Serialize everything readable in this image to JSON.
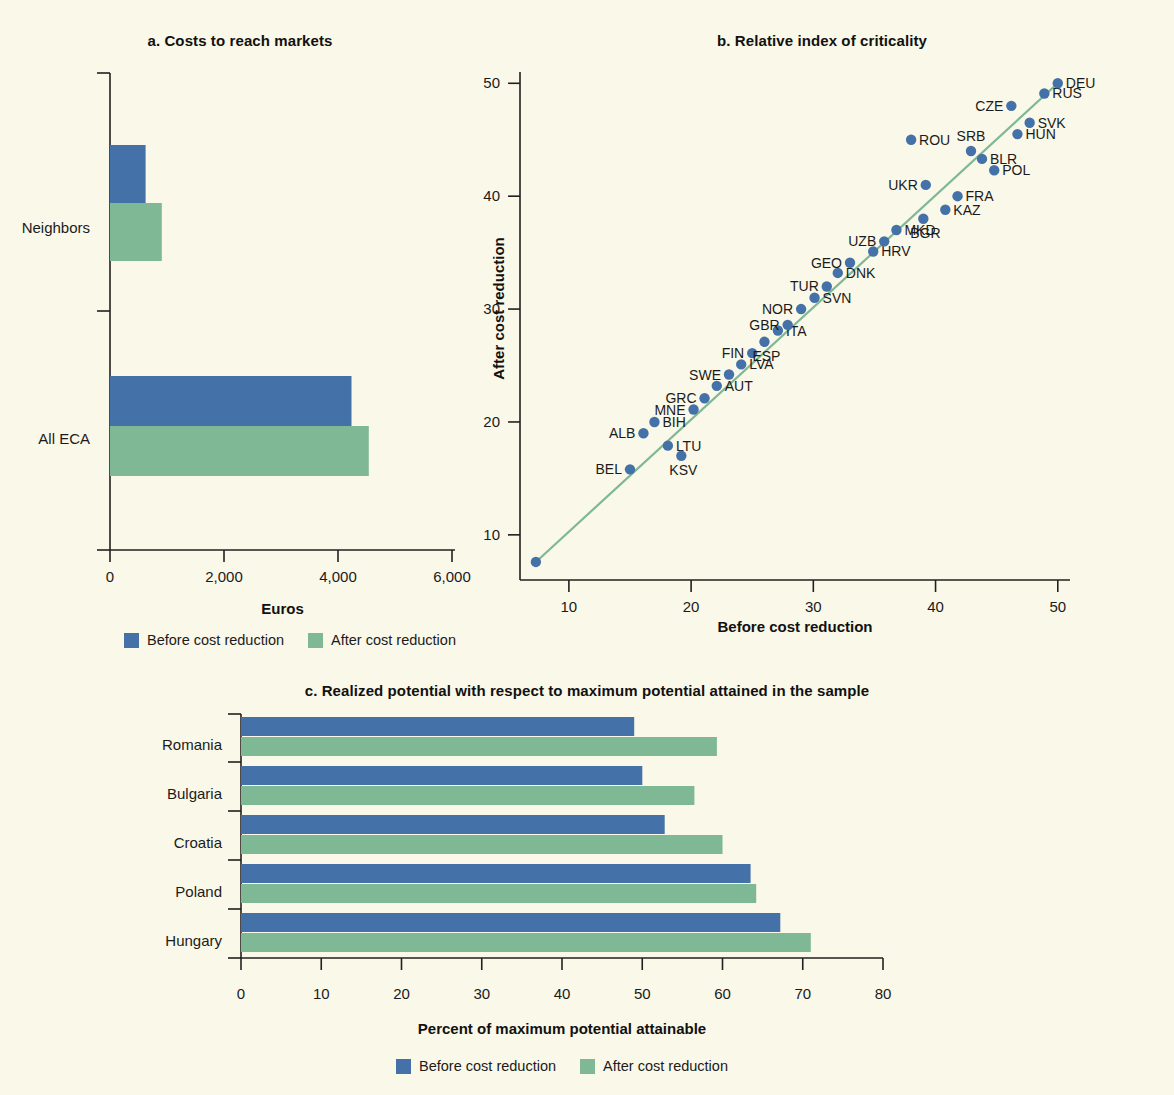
{
  "figure": {
    "background_color": "#faf8e8",
    "series_colors": {
      "before": "#4472a8",
      "after": "#7fb894",
      "fit_line": "#7fb894"
    }
  },
  "legend": {
    "before_label": "Before cost reduction",
    "after_label": "After cost reduction"
  },
  "panel_a": {
    "title": "a. Costs to reach markets",
    "xlabel": "Euros"
  },
  "panel_b": {
    "title": "b. Relative index of criticality",
    "xlabel": "Before cost reduction",
    "ylabel": "After cost reduction"
  },
  "panel_c": {
    "title": "c. Realized potential with respect to maximum potential attained in the sample",
    "xlabel": "Percent of maximum potential attainable"
  },
  "chart_data": [
    {
      "id": "a",
      "type": "bar",
      "orientation": "horizontal",
      "title": "a. Costs to reach markets",
      "xlabel": "Euros",
      "ylabel": "",
      "categories": [
        "Neighbors",
        "All ECA"
      ],
      "xlim": [
        0,
        6000
      ],
      "xticks": [
        0,
        2000,
        4000,
        6000
      ],
      "xticklabels": [
        "0",
        "2,000",
        "4,000",
        "6,000"
      ],
      "grid": false,
      "legend_position": "bottom",
      "series": [
        {
          "name": "Before cost reduction",
          "color": "#4472a8",
          "values": [
            620,
            4200
          ]
        },
        {
          "name": "After cost reduction",
          "color": "#7fb894",
          "values": [
            900,
            4500
          ]
        }
      ]
    },
    {
      "id": "b",
      "type": "scatter",
      "title": "b. Relative index of criticality",
      "xlabel": "Before cost reduction",
      "ylabel": "After cost reduction",
      "xlim": [
        6,
        51
      ],
      "ylim": [
        6,
        51
      ],
      "xticks": [
        10,
        20,
        30,
        40,
        50
      ],
      "yticks": [
        10,
        20,
        30,
        40,
        50
      ],
      "grid": false,
      "marker_color": "#4472a8",
      "fit_line": {
        "color": "#7fb894",
        "from": [
          7.3,
          7.6
        ],
        "to": [
          50.2,
          50.2
        ]
      },
      "points": [
        {
          "label": "",
          "x": 7.3,
          "y": 7.6,
          "label_pos": "none"
        },
        {
          "label": "BEL",
          "x": 15.0,
          "y": 15.8,
          "label_pos": "left"
        },
        {
          "label": "ALB",
          "x": 16.1,
          "y": 19.0,
          "label_pos": "left"
        },
        {
          "label": "BIH",
          "x": 17.0,
          "y": 20.0,
          "label_pos": "right"
        },
        {
          "label": "LTU",
          "x": 18.1,
          "y": 17.9,
          "label_pos": "right"
        },
        {
          "label": "KSV",
          "x": 19.2,
          "y": 17.0,
          "label_pos": "below"
        },
        {
          "label": "MNE",
          "x": 20.2,
          "y": 21.1,
          "label_pos": "left"
        },
        {
          "label": "GRC",
          "x": 21.1,
          "y": 22.1,
          "label_pos": "left"
        },
        {
          "label": "AUT",
          "x": 22.1,
          "y": 23.2,
          "label_pos": "right"
        },
        {
          "label": "SWE",
          "x": 23.1,
          "y": 24.2,
          "label_pos": "left"
        },
        {
          "label": "LVA",
          "x": 24.1,
          "y": 25.1,
          "label_pos": "right"
        },
        {
          "label": "FIN",
          "x": 25.0,
          "y": 26.1,
          "label_pos": "left"
        },
        {
          "label": "ESP",
          "x": 26.0,
          "y": 27.1,
          "label_pos": "below"
        },
        {
          "label": "ITA",
          "x": 27.1,
          "y": 28.1,
          "label_pos": "right"
        },
        {
          "label": "GBR",
          "x": 27.9,
          "y": 28.6,
          "label_pos": "left"
        },
        {
          "label": "NOR",
          "x": 29.0,
          "y": 30.0,
          "label_pos": "left"
        },
        {
          "label": "SVN",
          "x": 30.1,
          "y": 31.0,
          "label_pos": "right"
        },
        {
          "label": "TUR",
          "x": 31.1,
          "y": 32.0,
          "label_pos": "left"
        },
        {
          "label": "DNK",
          "x": 32.0,
          "y": 33.2,
          "label_pos": "right"
        },
        {
          "label": "GEO",
          "x": 33.0,
          "y": 34.1,
          "label_pos": "left"
        },
        {
          "label": "HRV",
          "x": 34.9,
          "y": 35.1,
          "label_pos": "right"
        },
        {
          "label": "UZB",
          "x": 35.8,
          "y": 36.0,
          "label_pos": "left"
        },
        {
          "label": "MKD",
          "x": 36.8,
          "y": 37.0,
          "label_pos": "right"
        },
        {
          "label": "ROU",
          "x": 38.0,
          "y": 45.0,
          "label_pos": "right"
        },
        {
          "label": "BGR",
          "x": 39.0,
          "y": 38.0,
          "label_pos": "below"
        },
        {
          "label": "UKR",
          "x": 39.2,
          "y": 41.0,
          "label_pos": "left"
        },
        {
          "label": "KAZ",
          "x": 40.8,
          "y": 38.8,
          "label_pos": "right"
        },
        {
          "label": "FRA",
          "x": 41.8,
          "y": 40.0,
          "label_pos": "right"
        },
        {
          "label": "SRB",
          "x": 42.9,
          "y": 44.0,
          "label_pos": "above"
        },
        {
          "label": "BLR",
          "x": 43.8,
          "y": 43.3,
          "label_pos": "right"
        },
        {
          "label": "POL",
          "x": 44.8,
          "y": 42.3,
          "label_pos": "right"
        },
        {
          "label": "CZE",
          "x": 46.2,
          "y": 48.0,
          "label_pos": "left"
        },
        {
          "label": "HUN",
          "x": 46.7,
          "y": 45.5,
          "label_pos": "right"
        },
        {
          "label": "SVK",
          "x": 47.7,
          "y": 46.5,
          "label_pos": "right"
        },
        {
          "label": "RUS",
          "x": 48.9,
          "y": 49.1,
          "label_pos": "right"
        },
        {
          "label": "DEU",
          "x": 50.0,
          "y": 50.0,
          "label_pos": "right"
        }
      ]
    },
    {
      "id": "c",
      "type": "bar",
      "orientation": "horizontal",
      "title": "c. Realized potential with respect to maximum potential attained in the sample",
      "xlabel": "Percent of maximum potential attainable",
      "ylabel": "",
      "categories": [
        "Romania",
        "Bulgaria",
        "Croatia",
        "Poland",
        "Hungary"
      ],
      "xlim": [
        0,
        80
      ],
      "xticks": [
        0,
        10,
        20,
        30,
        40,
        50,
        60,
        70,
        80
      ],
      "grid": false,
      "legend_position": "bottom",
      "series": [
        {
          "name": "Before cost reduction",
          "color": "#4472a8",
          "values": [
            49.0,
            50.0,
            52.8,
            63.5,
            67.2
          ]
        },
        {
          "name": "After cost reduction",
          "color": "#7fb894",
          "values": [
            59.3,
            56.5,
            60.0,
            64.2,
            71.0
          ]
        }
      ]
    }
  ]
}
